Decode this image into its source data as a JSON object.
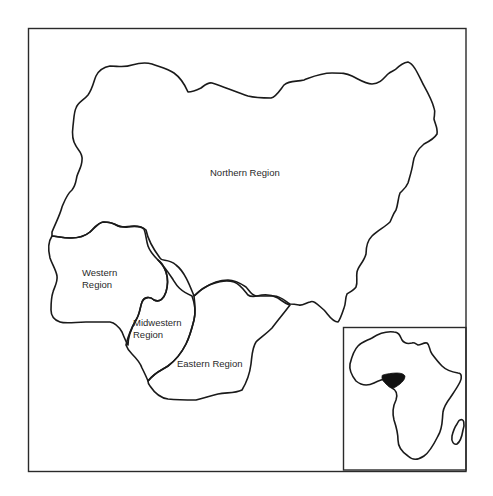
{
  "map": {
    "title_regions": [
      {
        "id": "northern",
        "label": "Northern Region"
      },
      {
        "id": "western",
        "label_line1": "Western",
        "label_line2": "Region"
      },
      {
        "id": "midwestern",
        "label_line1": "Midwestern",
        "label_line2": "Region"
      },
      {
        "id": "eastern",
        "label": "Eastern Region"
      }
    ],
    "colors": {
      "outline": "#1a1a1a",
      "frame": "#2a2a2a",
      "highlight": "#111111",
      "background": "#ffffff"
    },
    "inset": {
      "description": "Africa locator map with Nigeria highlighted"
    }
  }
}
